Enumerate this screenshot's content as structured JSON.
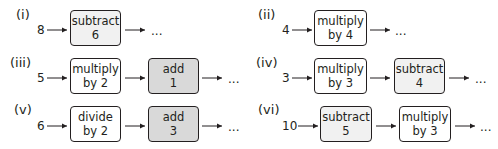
{
  "problems": [
    {
      "id": "i",
      "label": "(i)",
      "input": "8",
      "steps": [
        {
          "line1": "subtract",
          "line2": "6",
          "fill": "light"
        }
      ],
      "continuation": "..."
    },
    {
      "id": "ii",
      "label": "(ii)",
      "input": "4",
      "steps": [
        {
          "line1": "multiply",
          "line2": "by 4",
          "fill": "white"
        }
      ],
      "continuation": "..."
    },
    {
      "id": "iii",
      "label": "(iii)",
      "input": "5",
      "steps": [
        {
          "line1": "multiply",
          "line2": "by 2",
          "fill": "white"
        },
        {
          "line1": "add",
          "line2": "1",
          "fill": "mid"
        }
      ],
      "continuation": "..."
    },
    {
      "id": "iv",
      "label": "(iv)",
      "input": "3",
      "steps": [
        {
          "line1": "multiply",
          "line2": "by 3",
          "fill": "white"
        },
        {
          "line1": "subtract",
          "line2": "4",
          "fill": "light"
        }
      ],
      "continuation": "..."
    },
    {
      "id": "v",
      "label": "(v)",
      "input": "6",
      "steps": [
        {
          "line1": "divide",
          "line2": "by 2",
          "fill": "white"
        },
        {
          "line1": "add",
          "line2": "3",
          "fill": "mid"
        }
      ],
      "continuation": "..."
    },
    {
      "id": "vi",
      "label": "(vi)",
      "input": "10",
      "steps": [
        {
          "line1": "subtract",
          "line2": "5",
          "fill": "light"
        },
        {
          "line1": "multiply",
          "line2": "by 3",
          "fill": "white"
        }
      ],
      "continuation": "..."
    }
  ],
  "colors": {
    "stroke": "#231f20",
    "fill_white": "#ffffff",
    "fill_light": "#f1f1f1",
    "fill_mid": "#d9d9d9"
  }
}
